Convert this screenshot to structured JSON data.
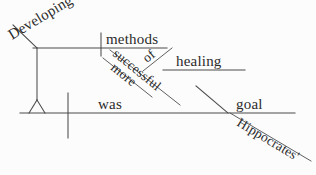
{
  "diagram": {
    "type": "reed-kellogg-sentence-diagram",
    "sentence": "Developing more successful methods of healing was Hippocrates' goal.",
    "canvas": {
      "width": 316,
      "height": 175
    },
    "colors": {
      "background": "#fcfcfc",
      "line": "#4a4a4a",
      "text": "#2b2b2b"
    },
    "words": {
      "developing": "Developing",
      "more": "more",
      "successful": "successful",
      "methods": "methods",
      "of": "of",
      "healing": "healing",
      "was": "was",
      "hippocrates": "Hippocrates'",
      "goal": "goal"
    },
    "labels": [
      {
        "key": "developing",
        "text": "Developing",
        "x": 12,
        "y": 40,
        "rotate": -31,
        "size": 15
      },
      {
        "key": "methods",
        "text": "methods",
        "x": 106,
        "y": 44,
        "rotate": 0,
        "size": 15
      },
      {
        "key": "of",
        "text": "of",
        "x": 147,
        "y": 63,
        "rotate": -39,
        "size": 14
      },
      {
        "key": "healing",
        "text": "healing",
        "x": 176,
        "y": 66,
        "rotate": 0,
        "size": 15
      },
      {
        "key": "successful",
        "text": "successful",
        "x": 112,
        "y": 55,
        "rotate": 39,
        "size": 13.5
      },
      {
        "key": "more",
        "text": "more",
        "x": 110,
        "y": 69,
        "rotate": 39,
        "size": 13.5
      },
      {
        "key": "was",
        "text": "was",
        "x": 98,
        "y": 109,
        "rotate": 0,
        "size": 15
      },
      {
        "key": "goal",
        "text": "goal",
        "x": 236,
        "y": 109,
        "rotate": 0,
        "size": 15
      },
      {
        "key": "hippocrates",
        "text": "Hippocrates'",
        "x": 236,
        "y": 125,
        "rotate": 31,
        "size": 14
      }
    ],
    "strokes": [
      {
        "name": "main-baseline",
        "x1": 20,
        "y1": 113,
        "x2": 295,
        "y2": 113
      },
      {
        "name": "subject-predicate-divider",
        "x1": 68,
        "y1": 93,
        "x2": 68,
        "y2": 138
      },
      {
        "name": "upper-baseline",
        "x1": 33,
        "y1": 48,
        "x2": 167,
        "y2": 48
      },
      {
        "name": "gerund-stand-post",
        "x1": 37,
        "y1": 48,
        "x2": 37,
        "y2": 100
      },
      {
        "name": "gerund-stand-left-leg",
        "x1": 37,
        "y1": 100,
        "x2": 29,
        "y2": 113
      },
      {
        "name": "gerund-stand-right-leg",
        "x1": 37,
        "y1": 100,
        "x2": 45,
        "y2": 113
      },
      {
        "name": "developing-diagonal",
        "x1": 13,
        "y1": 25,
        "x2": 37,
        "y2": 48
      },
      {
        "name": "methods-divider",
        "x1": 101,
        "y1": 33,
        "x2": 101,
        "y2": 56
      },
      {
        "name": "successful-modifier",
        "x1": 110,
        "y1": 50,
        "x2": 180,
        "y2": 105
      },
      {
        "name": "more-modifier",
        "x1": 103,
        "y1": 58,
        "x2": 152,
        "y2": 97
      },
      {
        "name": "of-preposition",
        "x1": 143,
        "y1": 71,
        "x2": 172,
        "y2": 48
      },
      {
        "name": "healing-line",
        "x1": 163,
        "y1": 70,
        "x2": 245,
        "y2": 70
      },
      {
        "name": "goal-complement-slant",
        "x1": 196,
        "y1": 86,
        "x2": 228,
        "y2": 113
      },
      {
        "name": "hippocrates-modifier",
        "x1": 230,
        "y1": 113,
        "x2": 311,
        "y2": 161
      }
    ]
  }
}
